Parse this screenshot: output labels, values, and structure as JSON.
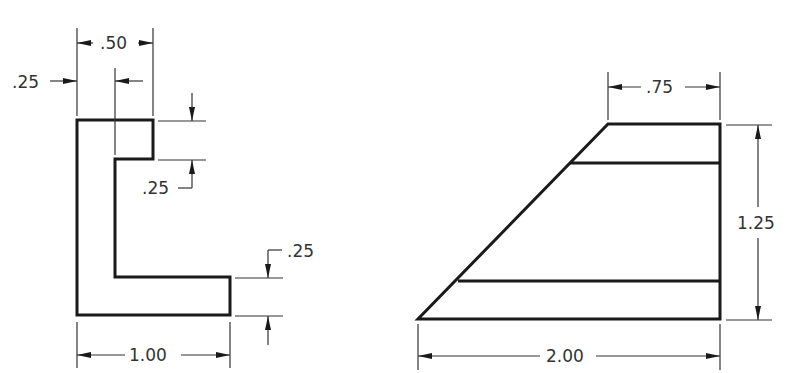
{
  "drawing": {
    "type": "orthographic technical drawing",
    "left_view": {
      "name": "L-shaped profile",
      "dimensions": {
        "top_width": ".50",
        "inner_offset": ".25",
        "top_notch_height": ".25",
        "bottom_flange_height": ".25",
        "overall_width": "1.00"
      }
    },
    "right_view": {
      "name": "trapezoidal view",
      "dimensions": {
        "top_width": ".75",
        "height": "1.25",
        "overall_width": "2.00"
      }
    },
    "colors": {
      "line": "#1a1a1a",
      "background": "#ffffff"
    }
  }
}
